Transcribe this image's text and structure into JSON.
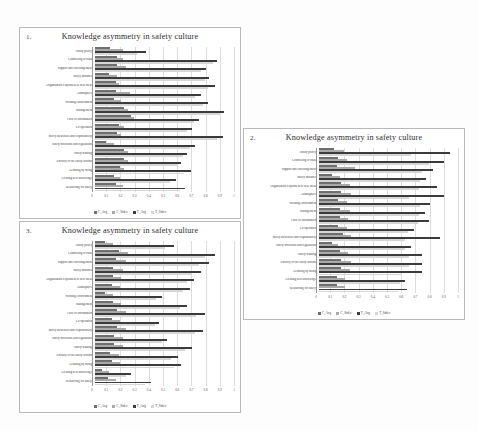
{
  "document": {
    "background": "#fdfdfd",
    "figure_count": 3
  },
  "panels": [
    {
      "number": "1.",
      "title": "Knowledge asymmetry in safety culture"
    },
    {
      "number": "2.",
      "title": "Knowledge asymmetry in safety culture"
    },
    {
      "number": "3.",
      "title": "Knowledge asymmetry in safety culture"
    }
  ],
  "legend": {
    "items": [
      {
        "label": "C_Avg",
        "color": "#6e6e6e"
      },
      {
        "label": "C_Stdev",
        "color": "#a9a9a9"
      },
      {
        "label": "T_Avg",
        "color": "#3b3b3b"
      },
      {
        "label": "T_Stdev",
        "color": "#d6d6d6"
      }
    ]
  },
  "axis": {
    "ticks": [
      "0",
      "0.1",
      "0.2",
      "0.3",
      "0.4",
      "0.5",
      "0.6",
      "0.7",
      "0.8",
      "0.9",
      "1"
    ],
    "min": 0,
    "max": 1
  },
  "categories": [
    "Safety policy",
    "Controlling of risks",
    "Support and encouragement",
    "Safety attitudes",
    "Organization's openness to new ideas",
    "Atmosphere",
    "Working environment",
    "Management",
    "Flow of information",
    "Co-operation",
    "Safety awareness and responsibility",
    "Safety directions and regulations",
    "Safety training",
    "Efficacy of the safety actions",
    "Learning by doing",
    "Creating new knowledge",
    "Resourcing for safety"
  ],
  "chart_data": [
    {
      "type": "bar",
      "orientation": "horizontal",
      "panel": "1.",
      "title": "Knowledge asymmetry in safety culture",
      "xlabel": "",
      "ylabel": "",
      "xlim": [
        0,
        1
      ],
      "grid": true,
      "legend_position": "bottom",
      "categories": [
        "Safety policy",
        "Controlling of risks",
        "Support and encouragement",
        "Safety attitudes",
        "Organization's openness to new ideas",
        "Atmosphere",
        "Working environment",
        "Management",
        "Flow of information",
        "Co-operation",
        "Safety awareness and responsibility",
        "Safety directions and regulations",
        "Safety training",
        "Efficacy of the safety actions",
        "Learning by doing",
        "Creating new knowledge",
        "Resourcing for safety"
      ],
      "series": [
        {
          "name": "C_Avg",
          "values": [
            0.11,
            0.16,
            0.16,
            0.1,
            0.15,
            0.15,
            0.14,
            0.21,
            0.26,
            0.17,
            0.16,
            0.08,
            0.21,
            0.21,
            0.18,
            0.14,
            0.15
          ]
        },
        {
          "name": "C_Stdev",
          "values": [
            0.2,
            0.2,
            0.22,
            0.16,
            0.17,
            0.25,
            0.19,
            0.24,
            0.28,
            0.21,
            0.19,
            0.14,
            0.24,
            0.24,
            0.21,
            0.18,
            0.2
          ]
        },
        {
          "name": "T_Avg",
          "values": [
            0.37,
            0.88,
            0.8,
            0.82,
            0.86,
            0.76,
            0.81,
            0.93,
            0.75,
            0.7,
            0.92,
            0.72,
            0.66,
            0.62,
            0.69,
            0.58,
            0.65
          ]
        },
        {
          "name": "T_Stdev",
          "values": [
            0.3,
            0.85,
            0.76,
            0.79,
            0.81,
            0.72,
            0.78,
            0.9,
            0.71,
            0.66,
            0.88,
            0.68,
            0.63,
            0.59,
            0.64,
            0.54,
            0.61
          ]
        }
      ]
    },
    {
      "type": "bar",
      "orientation": "horizontal",
      "panel": "2.",
      "title": "Knowledge asymmetry in safety culture",
      "xlabel": "",
      "ylabel": "",
      "xlim": [
        0,
        1
      ],
      "grid": true,
      "legend_position": "bottom",
      "categories": [
        "Safety policy",
        "Controlling of risks",
        "Support and encouragement",
        "Safety attitudes",
        "Organization's openness to new ideas",
        "Atmosphere",
        "Working environment",
        "Management",
        "Flow of information",
        "Co-operation",
        "Safety awareness and responsibility",
        "Safety directions and regulations",
        "Safety training",
        "Efficacy of the safety actions",
        "Learning by doing",
        "Creating new knowledge",
        "Resourcing for safety"
      ],
      "series": [
        {
          "name": "C_Avg",
          "values": [
            0.11,
            0.14,
            0.13,
            0.09,
            0.16,
            0.16,
            0.14,
            0.15,
            0.15,
            0.14,
            0.17,
            0.09,
            0.15,
            0.16,
            0.16,
            0.13,
            0.13
          ]
        },
        {
          "name": "C_Stdev",
          "values": [
            0.18,
            0.2,
            0.26,
            0.15,
            0.22,
            0.23,
            0.2,
            0.22,
            0.21,
            0.2,
            0.23,
            0.14,
            0.21,
            0.23,
            0.22,
            0.19,
            0.19
          ]
        },
        {
          "name": "T_Avg",
          "values": [
            0.94,
            0.9,
            0.82,
            0.77,
            0.85,
            0.9,
            0.8,
            0.76,
            0.79,
            0.68,
            0.87,
            0.66,
            0.74,
            0.74,
            0.74,
            0.62,
            0.63
          ]
        },
        {
          "name": "T_Stdev",
          "values": [
            0.66,
            0.79,
            0.74,
            0.73,
            0.72,
            0.65,
            0.73,
            0.72,
            0.71,
            0.64,
            0.62,
            0.62,
            0.65,
            0.65,
            0.59,
            0.58,
            0.57
          ]
        }
      ]
    },
    {
      "type": "bar",
      "orientation": "horizontal",
      "panel": "3.",
      "title": "Knowledge asymmetry in safety culture",
      "xlabel": "",
      "ylabel": "",
      "xlim": [
        0,
        1
      ],
      "grid": true,
      "legend_position": "bottom",
      "categories": [
        "Safety policy",
        "Controlling of risks",
        "Support and encouragement",
        "Safety attitudes",
        "Organization's openness to new ideas",
        "Atmosphere",
        "Working environment",
        "Management",
        "Flow of information",
        "Co-operation",
        "Safety awareness and responsibility",
        "Safety directions and regulations",
        "Safety training",
        "Efficacy of the safety actions",
        "Learning by doing",
        "Creating new knowledge",
        "Resourcing for safety"
      ],
      "series": [
        {
          "name": "C_Avg",
          "values": [
            0.07,
            0.17,
            0.15,
            0.13,
            0.13,
            0.12,
            0.07,
            0.13,
            0.16,
            0.12,
            0.16,
            0.14,
            0.14,
            0.11,
            0.12,
            0.05,
            0.09
          ]
        },
        {
          "name": "C_Stdev",
          "values": [
            0.13,
            0.24,
            0.22,
            0.2,
            0.19,
            0.18,
            0.13,
            0.19,
            0.22,
            0.18,
            0.22,
            0.2,
            0.2,
            0.17,
            0.18,
            0.1,
            0.15
          ]
        },
        {
          "name": "T_Avg",
          "values": [
            0.57,
            0.86,
            0.82,
            0.76,
            0.71,
            0.68,
            0.48,
            0.66,
            0.79,
            0.46,
            0.78,
            0.52,
            0.7,
            0.6,
            0.62,
            0.26,
            0.4
          ]
        },
        {
          "name": "T_Stdev",
          "values": [
            0.5,
            0.79,
            0.75,
            0.7,
            0.66,
            0.63,
            0.44,
            0.61,
            0.73,
            0.43,
            0.72,
            0.48,
            0.65,
            0.55,
            0.57,
            0.22,
            0.36
          ]
        }
      ]
    }
  ]
}
